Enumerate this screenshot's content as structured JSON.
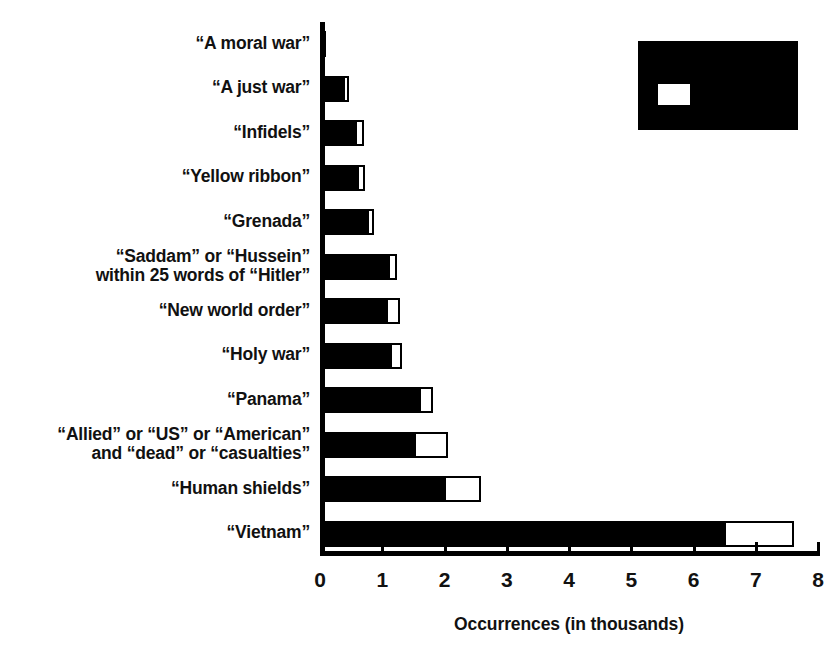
{
  "chart_data": {
    "type": "bar",
    "orientation": "horizontal",
    "title": "",
    "xlabel": "Occurrences (in thousands)",
    "ylabel": "",
    "xlim": [
      0,
      8
    ],
    "xticks": [
      0,
      1,
      2,
      3,
      4,
      5,
      6,
      7,
      8
    ],
    "xtick_labels": [
      "0",
      "1",
      "2",
      "3",
      "4",
      "5",
      "6",
      "7",
      "8"
    ],
    "grid": false,
    "legend_position": "top-right",
    "legend_redacted": true,
    "stacked": true,
    "categories": [
      "“A moral war”",
      "“A just war”",
      "“Infidels”",
      "“Yellow ribbon”",
      "“Grenada”",
      "“Saddam” or “Hussein”\nwithin 25 words of “Hitler”",
      "“New world order”",
      "“Holy war”",
      "“Panama”",
      "“Allied” or “US” or “American”\nand “dead” or “casualties”",
      "“Human shields”",
      "“Vietnam”"
    ],
    "series": [
      {
        "name": "black-segment",
        "color": "#000000",
        "values": [
          0.06,
          0.4,
          0.6,
          0.62,
          0.78,
          1.12,
          1.1,
          1.15,
          1.62,
          1.55,
          2.02,
          6.52
        ]
      },
      {
        "name": "white-segment",
        "color": "#ffffff",
        "values": [
          0.03,
          0.07,
          0.1,
          0.1,
          0.08,
          0.12,
          0.18,
          0.17,
          0.2,
          0.5,
          0.57,
          1.1
        ]
      }
    ],
    "totals": [
      0.09,
      0.47,
      0.7,
      0.72,
      0.86,
      1.24,
      1.28,
      1.32,
      1.82,
      2.05,
      2.59,
      7.62
    ]
  },
  "legend": {
    "swatch_label": "",
    "note": ""
  }
}
